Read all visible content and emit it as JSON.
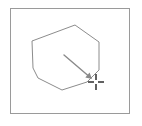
{
  "figure": {
    "title": "",
    "background_color": "#ffffff",
    "width": 142,
    "height": 126
  },
  "frame": {
    "name": "outer-frame",
    "x": 10,
    "y": 8,
    "width": 119,
    "height": 105,
    "stroke_color": "#9a9a9a",
    "stroke_width": 1,
    "fill": "none"
  },
  "polygon": {
    "name": "hexagon-outline",
    "sides": 7,
    "stroke_color": "#8c8c8c",
    "stroke_width": 1,
    "fill": "none",
    "points": "75,25 99,42 99,70 87,82 62,90 38,78 33,68 32,41",
    "vertices": [
      {
        "x": 75,
        "y": 25
      },
      {
        "x": 99,
        "y": 42
      },
      {
        "x": 99,
        "y": 70
      },
      {
        "x": 87,
        "y": 82
      },
      {
        "x": 62,
        "y": 90
      },
      {
        "x": 38,
        "y": 78
      },
      {
        "x": 33,
        "y": 68
      },
      {
        "x": 32,
        "y": 41
      }
    ]
  },
  "arrow": {
    "name": "pointer-arrow",
    "stroke_color": "#8a8a8a",
    "stroke_width": 1.4,
    "start": {
      "x": 64,
      "y": 55
    },
    "end": {
      "x": 92,
      "y": 79
    },
    "head_size": 6,
    "direction": "down-right"
  },
  "crosshair": {
    "name": "target-crosshair",
    "center": {
      "x": 96,
      "y": 82
    },
    "arm_length": 6,
    "gap": 2,
    "stroke_color": "#3a3a3a",
    "stroke_width": 1.6
  },
  "labels": {
    "caption": "",
    "annotations": []
  }
}
